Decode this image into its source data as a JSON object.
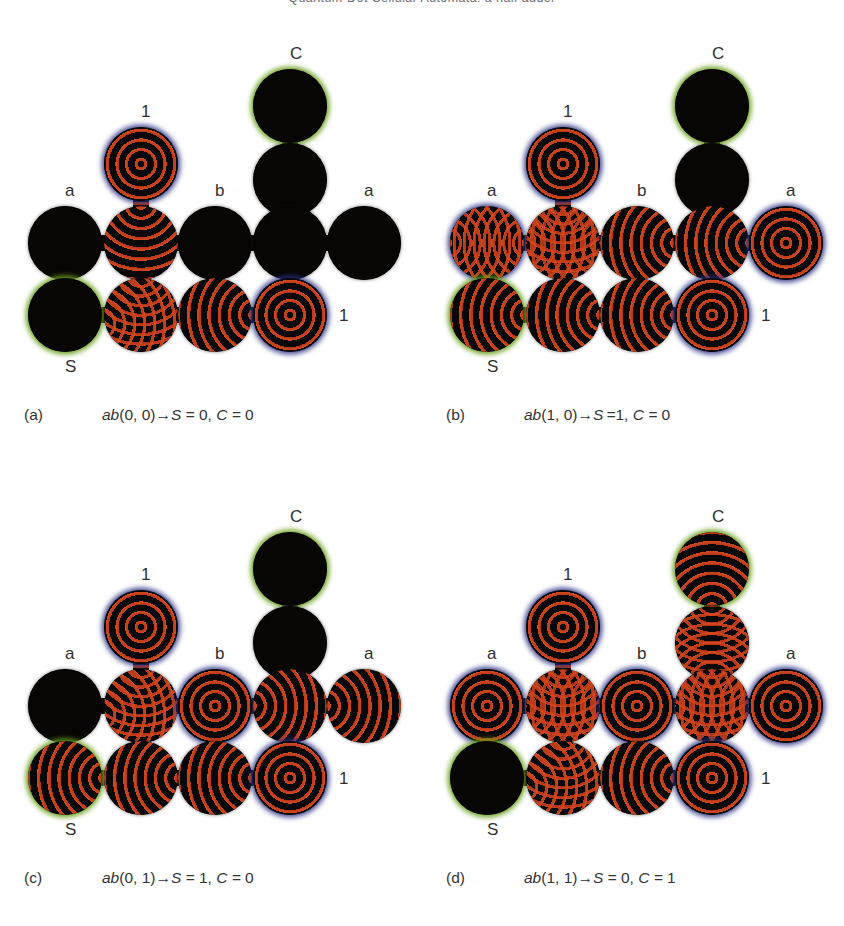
{
  "running_head": "Quantum-Dot Cellular Automata: a half adder",
  "figure": {
    "cell_labels": {
      "input_a_left": "a",
      "input_b": "b",
      "input_a_right": "a",
      "const_one_top": "1",
      "const_one_bottom": "1",
      "output_sum": "S",
      "output_carry": "C"
    },
    "colors": {
      "wave_red": "#c2411c",
      "cell_dark": "#070604",
      "halo_blue": "#283282",
      "halo_green": "#68a01a",
      "page_background": "#ffffff",
      "text": "#2f2f2f"
    }
  },
  "panels": [
    {
      "id": "a",
      "tag": "(a)",
      "expr_prefix": "ab",
      "inputs": "(0, 0)",
      "arrow": "→",
      "sum_label": "S",
      "sum_eq": " = ",
      "sum_value": "0",
      "sep": ", ",
      "carry_label": "C",
      "carry_eq": " = ",
      "carry_value": "1",
      "caption": "(a)  ab(0, 0)→S = 0, C = 0",
      "inputs_ab": [
        0,
        0
      ],
      "output_S": 0,
      "output_C": 0,
      "cells": [
        {
          "name": "carry-out",
          "label": "C",
          "label_pos": "top",
          "halo": "green",
          "wave": "dark"
        },
        {
          "name": "carry-relay",
          "label": "",
          "label_pos": "",
          "halo": "none",
          "wave": "dark"
        },
        {
          "name": "const-one-top",
          "label": "1",
          "label_pos": "top",
          "halo": "blue",
          "wave": "target"
        },
        {
          "name": "input-a-left",
          "label": "a",
          "label_pos": "top",
          "halo": "none",
          "wave": "dark"
        },
        {
          "name": "mid-col2",
          "label": "",
          "label_pos": "",
          "halo": "none",
          "wave": "top"
        },
        {
          "name": "input-b",
          "label": "b",
          "label_pos": "top",
          "halo": "none",
          "wave": "dark"
        },
        {
          "name": "mid-col4",
          "label": "",
          "label_pos": "",
          "halo": "none",
          "wave": "dark"
        },
        {
          "name": "input-a-right",
          "label": "a",
          "label_pos": "top",
          "halo": "none",
          "wave": "dark"
        },
        {
          "name": "output-sum",
          "label": "S",
          "label_pos": "bottom",
          "halo": "green",
          "wave": "dark"
        },
        {
          "name": "bot-col2",
          "label": "",
          "label_pos": "",
          "halo": "none",
          "wave": "mix-lt"
        },
        {
          "name": "bot-col3",
          "label": "",
          "label_pos": "",
          "halo": "none",
          "wave": "right"
        },
        {
          "name": "const-one-bot",
          "label": "1",
          "label_pos": "right",
          "halo": "blue",
          "wave": "target"
        }
      ]
    },
    {
      "id": "b",
      "tag": "(b)",
      "caption": "(b)  ab(1, 0)→S =1, C = 0",
      "inputs_ab": [
        1,
        0
      ],
      "output_S": 1,
      "output_C": 0,
      "cells": [
        {
          "name": "carry-out",
          "label": "C",
          "label_pos": "top",
          "halo": "green",
          "wave": "dark"
        },
        {
          "name": "carry-relay",
          "label": "",
          "label_pos": "",
          "halo": "none",
          "wave": "dark"
        },
        {
          "name": "const-one-top",
          "label": "1",
          "label_pos": "top",
          "halo": "blue",
          "wave": "target"
        },
        {
          "name": "input-a-left",
          "label": "a",
          "label_pos": "top",
          "halo": "blue",
          "wave": "mix-lr"
        },
        {
          "name": "mid-col2",
          "label": "",
          "label_pos": "",
          "halo": "none",
          "wave": "mix-lrt"
        },
        {
          "name": "input-b",
          "label": "b",
          "label_pos": "top",
          "halo": "none",
          "wave": "right"
        },
        {
          "name": "mid-col4",
          "label": "",
          "label_pos": "",
          "halo": "none",
          "wave": "right"
        },
        {
          "name": "input-a-right",
          "label": "a",
          "label_pos": "top",
          "halo": "blue",
          "wave": "target"
        },
        {
          "name": "output-sum",
          "label": "S",
          "label_pos": "bottom",
          "halo": "green",
          "wave": "right"
        },
        {
          "name": "bot-col2",
          "label": "",
          "label_pos": "",
          "halo": "none",
          "wave": "right"
        },
        {
          "name": "bot-col3",
          "label": "",
          "label_pos": "",
          "halo": "none",
          "wave": "right"
        },
        {
          "name": "const-one-bot",
          "label": "1",
          "label_pos": "right",
          "halo": "blue",
          "wave": "target"
        }
      ]
    },
    {
      "id": "c",
      "tag": "(c)",
      "caption": "(c)  ab(0, 1)→S = 1, C = 0",
      "inputs_ab": [
        0,
        1
      ],
      "output_S": 1,
      "output_C": 0,
      "cells": [
        {
          "name": "carry-out",
          "label": "C",
          "label_pos": "top",
          "halo": "green",
          "wave": "dark"
        },
        {
          "name": "carry-relay",
          "label": "",
          "label_pos": "",
          "halo": "none",
          "wave": "dark"
        },
        {
          "name": "const-one-top",
          "label": "1",
          "label_pos": "top",
          "halo": "blue",
          "wave": "target"
        },
        {
          "name": "input-a-left",
          "label": "a",
          "label_pos": "top",
          "halo": "none",
          "wave": "dark"
        },
        {
          "name": "mid-col2",
          "label": "",
          "label_pos": "",
          "halo": "none",
          "wave": "mix-lt"
        },
        {
          "name": "input-b",
          "label": "b",
          "label_pos": "top",
          "halo": "blue",
          "wave": "target"
        },
        {
          "name": "mid-col4",
          "label": "",
          "label_pos": "",
          "halo": "none",
          "wave": "left"
        },
        {
          "name": "input-a-right",
          "label": "a",
          "label_pos": "top",
          "halo": "none",
          "wave": "left"
        },
        {
          "name": "output-sum",
          "label": "S",
          "label_pos": "bottom",
          "halo": "green",
          "wave": "right"
        },
        {
          "name": "bot-col2",
          "label": "",
          "label_pos": "",
          "halo": "none",
          "wave": "right"
        },
        {
          "name": "bot-col3",
          "label": "",
          "label_pos": "",
          "halo": "none",
          "wave": "right"
        },
        {
          "name": "const-one-bot",
          "label": "1",
          "label_pos": "right",
          "halo": "blue",
          "wave": "target"
        }
      ]
    },
    {
      "id": "d",
      "tag": "(d)",
      "caption": "(d)  ab(1, 1)→S = 0, C = 1",
      "inputs_ab": [
        1,
        1
      ],
      "output_S": 0,
      "output_C": 1,
      "cells": [
        {
          "name": "carry-out",
          "label": "C",
          "label_pos": "top",
          "halo": "green",
          "wave": "bottom"
        },
        {
          "name": "carry-relay",
          "label": "",
          "label_pos": "",
          "halo": "none",
          "wave": "mix-tb"
        },
        {
          "name": "const-one-top",
          "label": "1",
          "label_pos": "top",
          "halo": "blue",
          "wave": "target"
        },
        {
          "name": "input-a-left",
          "label": "a",
          "label_pos": "top",
          "halo": "blue",
          "wave": "target"
        },
        {
          "name": "mid-col2",
          "label": "",
          "label_pos": "",
          "halo": "none",
          "wave": "mix-lrt"
        },
        {
          "name": "input-b",
          "label": "b",
          "label_pos": "top",
          "halo": "blue",
          "wave": "target"
        },
        {
          "name": "mid-col4",
          "label": "",
          "label_pos": "",
          "halo": "none",
          "wave": "mix-lrt"
        },
        {
          "name": "input-a-right",
          "label": "a",
          "label_pos": "top",
          "halo": "blue",
          "wave": "target"
        },
        {
          "name": "output-sum",
          "label": "S",
          "label_pos": "bottom",
          "halo": "green",
          "wave": "dark"
        },
        {
          "name": "bot-col2",
          "label": "",
          "label_pos": "",
          "halo": "none",
          "wave": "mix-lt"
        },
        {
          "name": "bot-col3",
          "label": "",
          "label_pos": "",
          "halo": "none",
          "wave": "right"
        },
        {
          "name": "const-one-bot",
          "label": "1",
          "label_pos": "right",
          "halo": "blue",
          "wave": "target"
        }
      ]
    }
  ],
  "layout": {
    "cell_slots": [
      {
        "name": "carry-out",
        "x": 253,
        "y": 69,
        "label_dx": 37,
        "label_dy": -24
      },
      {
        "name": "carry-relay",
        "x": 253,
        "y": 143,
        "label_dx": 37,
        "label_dy": -24
      },
      {
        "name": "const-one-top",
        "x": 104,
        "y": 127,
        "label_dx": 37,
        "label_dy": -24
      },
      {
        "name": "input-a-left",
        "x": 28,
        "y": 206,
        "label_dx": 37,
        "label_dy": -24
      },
      {
        "name": "mid-col2",
        "x": 104,
        "y": 206,
        "label_dx": 37,
        "label_dy": -24
      },
      {
        "name": "input-b",
        "x": 178,
        "y": 206,
        "label_dx": 37,
        "label_dy": -24
      },
      {
        "name": "mid-col4",
        "x": 253,
        "y": 206,
        "label_dx": 37,
        "label_dy": -24
      },
      {
        "name": "input-a-right",
        "x": 327,
        "y": 206,
        "label_dx": 37,
        "label_dy": -24
      },
      {
        "name": "output-sum",
        "x": 28,
        "y": 278,
        "label_dx": 37,
        "label_dy": 80
      },
      {
        "name": "bot-col2",
        "x": 104,
        "y": 278,
        "label_dx": 37,
        "label_dy": 80
      },
      {
        "name": "bot-col3",
        "x": 178,
        "y": 278,
        "label_dx": 37,
        "label_dy": 80
      },
      {
        "name": "const-one-bot",
        "x": 253,
        "y": 278,
        "label_dx": 86,
        "label_dy": 29
      }
    ]
  }
}
